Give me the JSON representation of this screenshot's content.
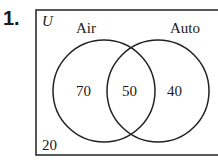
{
  "problem": {
    "number": "1."
  },
  "venn": {
    "universe_label": "U",
    "sets": [
      {
        "label": "Air",
        "only_value": "70"
      },
      {
        "label": "Auto",
        "only_value": "40"
      }
    ],
    "intersection_value": "50",
    "outside_value": "20"
  }
}
